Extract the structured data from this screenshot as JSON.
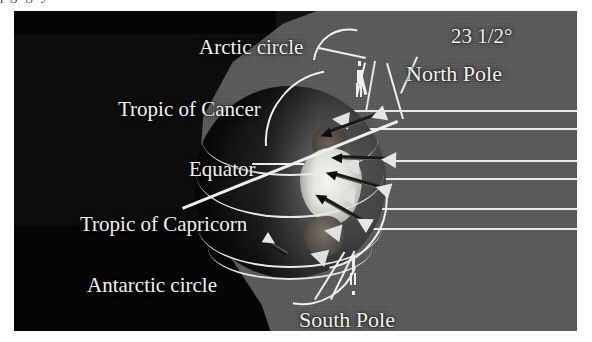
{
  "figure": {
    "cutoff_text_above": "pg  g                                                                y",
    "background_dark": "#050505",
    "sunlit_gray": "#585858",
    "ray_color": "#e8e8e8",
    "label_color": "#f2f2ee"
  },
  "labels": [
    {
      "id": "arctic-circle",
      "text": "Arctic circle",
      "x": 185,
      "y": 24,
      "size": 21
    },
    {
      "id": "north-pole",
      "text": "North Pole",
      "x": 392,
      "y": 50,
      "size": 22
    },
    {
      "id": "angle",
      "text": "23 1/2°",
      "x": 437,
      "y": 13,
      "size": 21
    },
    {
      "id": "tropic-of-cancer",
      "text": "Tropic of Cancer",
      "x": 104,
      "y": 86,
      "size": 21
    },
    {
      "id": "equator",
      "text": "Equator",
      "x": 175,
      "y": 146,
      "size": 21
    },
    {
      "id": "tropic-of-capricorn",
      "text": "Tropic of Capricorn",
      "x": 66,
      "y": 201,
      "size": 21
    },
    {
      "id": "antarctic-circle",
      "text": "Antarctic circle",
      "x": 73,
      "y": 262,
      "size": 21
    },
    {
      "id": "south-pole",
      "text": "South Pole",
      "x": 285,
      "y": 296,
      "size": 22
    }
  ],
  "chart_data": {
    "type": "diagram",
    "axial_tilt_degrees": "23 1/2°",
    "latitude_circles": [
      "Arctic circle",
      "Tropic of Cancer",
      "Equator",
      "Tropic of Capricorn",
      "Antarctic circle"
    ],
    "poles": [
      "North Pole",
      "South Pole"
    ],
    "sun_rays": {
      "orientation": "horizontal-parallel",
      "count": 6,
      "y_positions": [
        99,
        117,
        149,
        167,
        197,
        217
      ],
      "color": "#e8e8e8"
    },
    "regions": [
      {
        "name": "night-side",
        "color": "#050505"
      },
      {
        "name": "sunlit-space",
        "color": "#585858"
      }
    ]
  },
  "rays": [
    {
      "y": 99,
      "width": 300
    },
    {
      "y": 117,
      "width": 268
    },
    {
      "y": 149,
      "width": 262
    },
    {
      "y": 167,
      "width": 270
    },
    {
      "y": 197,
      "width": 262
    },
    {
      "y": 217,
      "width": 268
    }
  ],
  "darts": [
    {
      "id": "dart-north",
      "x": 368,
      "y": 104,
      "len": 58,
      "rot": 160
    },
    {
      "id": "dart-cancer",
      "x": 378,
      "y": 150,
      "len": 54,
      "rot": 182
    },
    {
      "id": "dart-equator",
      "x": 372,
      "y": 180,
      "len": 56,
      "rot": 196
    },
    {
      "id": "dart-capricorn",
      "x": 352,
      "y": 214,
      "len": 52,
      "rot": 210
    }
  ]
}
